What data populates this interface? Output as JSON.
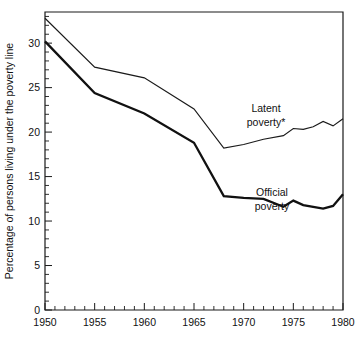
{
  "chart_data": {
    "type": "line",
    "title": "",
    "xlabel": "",
    "ylabel": "Percentage of persons living under the poverty line",
    "xlim": [
      1950,
      1980
    ],
    "ylim": [
      0,
      33.5
    ],
    "grid": false,
    "legend_position": "inline-annotations",
    "x_ticks_major": [
      1950,
      1955,
      1960,
      1965,
      1970,
      1975,
      1980
    ],
    "x_tick_labels": [
      "1950",
      "1955",
      "1960",
      "1965",
      "1970",
      "1975",
      "1980"
    ],
    "x_minor_tick_step": 1,
    "y_ticks_major": [
      0,
      5,
      10,
      15,
      20,
      25,
      30
    ],
    "y_tick_labels": [
      "0",
      "5",
      "10",
      "15",
      "20",
      "25",
      "30"
    ],
    "y_minor_tick_step": 1,
    "series": [
      {
        "name": "Latent poverty*",
        "annotation_label_line1": "Latent",
        "annotation_label_line2": "poverty*",
        "color": "#1a1a1a",
        "line_width": "thin",
        "x": [
          1950,
          1955,
          1960,
          1965,
          1968,
          1970,
          1972,
          1974,
          1975,
          1976,
          1977,
          1978,
          1979,
          1980
        ],
        "values": [
          32.8,
          27.3,
          26.1,
          22.6,
          18.2,
          18.6,
          19.2,
          19.6,
          20.4,
          20.3,
          20.6,
          21.2,
          20.7,
          21.5
        ]
      },
      {
        "name": "Official poverty",
        "annotation_label_line1": "Official",
        "annotation_label_line2": "poverty",
        "color": "#111111",
        "line_width": "thick",
        "x": [
          1950,
          1955,
          1960,
          1965,
          1968,
          1970,
          1972,
          1974,
          1975,
          1976,
          1977,
          1978,
          1979,
          1980
        ],
        "values": [
          30.2,
          24.4,
          22.1,
          18.8,
          12.8,
          12.6,
          12.5,
          11.6,
          12.3,
          11.8,
          11.6,
          11.4,
          11.7,
          13.0
        ]
      }
    ]
  },
  "axis": {
    "y_title": "Percentage of persons living under the poverty line"
  }
}
